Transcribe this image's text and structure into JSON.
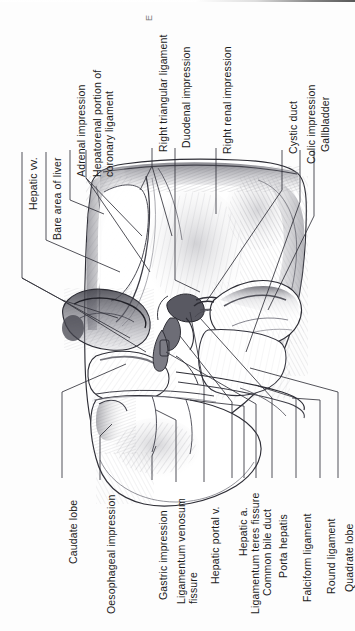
{
  "figure": {
    "orientation_note": "All label text is rotated 90 degrees counter-clockwise",
    "background_color": "#fdfdfd",
    "ink_color": "#1b1b1b",
    "leader_color": "#33333b"
  },
  "artifacts": {
    "scan_speck": "E"
  },
  "labels": {
    "top": [
      {
        "id": "hepatic-vv",
        "text": "Hepatic vv."
      },
      {
        "id": "bare-area",
        "text": "Bare area of liver"
      },
      {
        "id": "adrenal",
        "text": "Adrenal impression"
      },
      {
        "id": "hepatorenal",
        "text": "Hepatorenal portion of coronary ligament"
      },
      {
        "id": "right-triangular",
        "text": "Right triangular ligament"
      },
      {
        "id": "duodenal",
        "text": "Duodenal impression"
      },
      {
        "id": "right-renal",
        "text": "Right renal impression"
      },
      {
        "id": "cystic-duct",
        "text": "Cystic duct"
      },
      {
        "id": "colic",
        "text": "Colic impression"
      },
      {
        "id": "gallbladder",
        "text": "Gallbladder"
      }
    ],
    "bottom": [
      {
        "id": "caudate-lobe",
        "text": "Caudate lobe"
      },
      {
        "id": "oesophageal",
        "text": "Oesophageal impression"
      },
      {
        "id": "gastric",
        "text": "Gastric impression"
      },
      {
        "id": "lig-venosum",
        "text": "Ligamentum venosum fissure"
      },
      {
        "id": "hepatic-portal-v",
        "text": "Hepatic portal v."
      },
      {
        "id": "hepatic-a",
        "text": "Hepatic a."
      },
      {
        "id": "lig-teres",
        "text": "Ligamentum teres fissure"
      },
      {
        "id": "common-bile-duct",
        "text": "Common bile duct"
      },
      {
        "id": "porta-hepatis",
        "text": "Porta hepatis"
      },
      {
        "id": "falciform",
        "text": "Falciform ligament"
      },
      {
        "id": "round-ligament",
        "text": "Round ligament"
      },
      {
        "id": "quadrate-lobe",
        "text": "Quadrate lobe"
      }
    ]
  }
}
